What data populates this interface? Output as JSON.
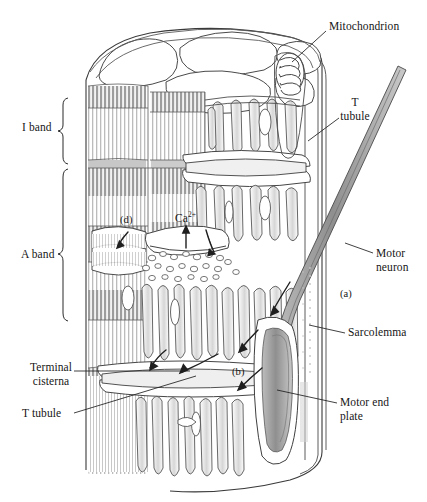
{
  "figure": {
    "style": "pen-and-ink line art, grayscale on white",
    "width_px": 427,
    "height_px": 502
  },
  "colors": {
    "ink": "#161616",
    "line": "#3a3a3a",
    "line_light": "#8d8d8d",
    "hatch": "#b6b6b6",
    "hatch_dark": "#9a9a9a",
    "fill_white": "#ffffff",
    "fill_shade": "#ededed",
    "neuron_fill": "#9e9e9e",
    "background": "#ffffff",
    "faint_caption": "#e9e9ec"
  },
  "labels": {
    "mitochondrion": "Mitochondrion",
    "t_tubule_right": "T\ntubule",
    "motor_neuron": "Motor\nneuron",
    "sarcolemma": "Sarcolemma",
    "motor_end_plate": "Motor end\nplate",
    "i_band": "I band",
    "a_band": "A band",
    "terminal_cisterna": "Terminal\ncisterna",
    "t_tubule_left": "T tubule",
    "marker_a": "(a)",
    "marker_b": "(b)",
    "marker_d": "(d)",
    "calcium": "Ca",
    "calcium_charge": "2+"
  },
  "label_positions": {
    "mitochondrion": {
      "x": 329,
      "y": 26,
      "align": "left"
    },
    "t_tubule_right": {
      "x": 341,
      "y": 102,
      "align": "left"
    },
    "motor_neuron": {
      "x": 376,
      "y": 247,
      "align": "left"
    },
    "sarcolemma": {
      "x": 348,
      "y": 331,
      "align": "left"
    },
    "motor_end_plate": {
      "x": 340,
      "y": 396,
      "align": "left"
    },
    "i_band": {
      "x": 22,
      "y": 120,
      "align": "left"
    },
    "a_band": {
      "x": 21,
      "y": 248,
      "align": "left"
    },
    "terminal_cisterna": {
      "x": 22,
      "y": 361,
      "align": "left"
    },
    "t_tubule_left": {
      "x": 22,
      "y": 407,
      "align": "left"
    },
    "marker_a": {
      "x": 340,
      "y": 289,
      "align": "left"
    },
    "marker_b": {
      "x": 232,
      "y": 366,
      "align": "left"
    },
    "marker_d": {
      "x": 120,
      "y": 214,
      "align": "left"
    },
    "calcium": {
      "x": 175,
      "y": 211,
      "align": "left"
    }
  },
  "brackets": [
    {
      "name": "i-band-bracket",
      "label": "I band",
      "x": 64,
      "y_top": 98,
      "y_bottom": 164
    },
    {
      "name": "a-band-bracket",
      "label": "A band",
      "x": 64,
      "y_top": 169,
      "y_bottom": 321
    }
  ],
  "leader_lines": [
    {
      "name": "mitochondrion-leader",
      "from": [
        326,
        31
      ],
      "to": [
        289,
        63
      ]
    },
    {
      "name": "t-tubule-right-leader",
      "from": [
        339,
        118
      ],
      "to": [
        309,
        141
      ]
    },
    {
      "name": "motor-neuron-leader",
      "from": [
        373,
        253
      ],
      "to": [
        345,
        243
      ]
    },
    {
      "name": "sarcolemma-leader",
      "from": [
        345,
        333
      ],
      "to": [
        310,
        325
      ]
    },
    {
      "name": "motor-end-plate-leader",
      "from": [
        337,
        403
      ],
      "to": [
        277,
        390
      ]
    },
    {
      "name": "terminal-cisterna-leader",
      "from": [
        74,
        371
      ],
      "to": [
        182,
        371
      ]
    },
    {
      "name": "t-tubule-left-leader",
      "from": [
        74,
        413
      ],
      "to": [
        190,
        378
      ]
    }
  ],
  "structures": [
    {
      "name": "muscle-fiber-body",
      "description": "cylindrical skeletal muscle fiber, cut away"
    },
    {
      "name": "myofibril-cross-sections",
      "count": 6,
      "description": "rounded myofibril end faces across top cut surface"
    },
    {
      "name": "myofibril-striations",
      "description": "vertical banded myofilaments showing I band and A band"
    },
    {
      "name": "sarcoplasmic-reticulum",
      "description": "network of longitudinal tubules wrapping each myofibril"
    },
    {
      "name": "terminal-cisternae",
      "description": "enlarged SR sacs flanking each T tubule"
    },
    {
      "name": "t-tubule",
      "description": "transverse tubule invagination of the sarcolemma"
    },
    {
      "name": "mitochondrion",
      "description": "coiled organelle at upper right between myofibrils"
    },
    {
      "name": "sarcolemma",
      "description": "outer plasma membrane of the muscle fiber"
    },
    {
      "name": "motor-neuron-axon",
      "description": "shaded axon descending from upper right to the end plate"
    },
    {
      "name": "motor-end-plate",
      "description": "elongated synaptic terminal on the sarcolemma surface"
    },
    {
      "name": "calcium-release-arrows",
      "description": "arrows showing Ca2+ movement out of terminal cisternae"
    },
    {
      "name": "signal-arrows",
      "description": "arrows (a) and (b) tracing impulse from axon along sarcolemma"
    }
  ]
}
